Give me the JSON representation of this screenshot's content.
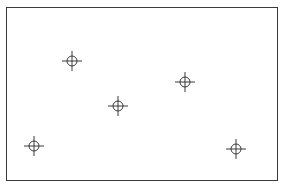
{
  "figure": {
    "title": "",
    "background_color": "#ffffff",
    "frame": {
      "border_color": "#3a3a3c",
      "border_width_px": 1.5,
      "x_px": 6,
      "y_px": 7,
      "width_px": 272,
      "height_px": 174
    }
  },
  "chart_data": {
    "type": "scatter",
    "title": "",
    "xlabel": "",
    "ylabel": "",
    "xlim": [
      0,
      286
    ],
    "ylim": [
      191,
      0
    ],
    "grid": false,
    "legend": null,
    "tick_labels": {
      "x": [],
      "y": []
    },
    "marker": {
      "style": "circle-with-crosshair",
      "color": "#3a3a3c",
      "circle_radius_px": 5,
      "cross_arm_px": 10,
      "line_width_px": 1
    },
    "point_count": 5,
    "points": [
      {
        "label": "point-1",
        "x": 72,
        "y": 61
      },
      {
        "label": "point-2",
        "x": 185,
        "y": 82
      },
      {
        "label": "point-3",
        "x": 118,
        "y": 106
      },
      {
        "label": "point-4",
        "x": 34,
        "y": 146
      },
      {
        "label": "point-5",
        "x": 236,
        "y": 149
      }
    ]
  }
}
